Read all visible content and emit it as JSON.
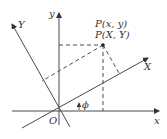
{
  "diagram": {
    "type": "coordinate-rotation",
    "colors": {
      "line": "#4a4a4a",
      "text": "#333333",
      "background": "#ffffff"
    },
    "labels": {
      "x_axis": "x",
      "y_axis": "y",
      "X_axis": "X",
      "Y_axis": "Y",
      "origin": "O",
      "angle": "ϕ",
      "point_xy": "P(x, y)",
      "point_XY": "P(X, Y)"
    }
  }
}
